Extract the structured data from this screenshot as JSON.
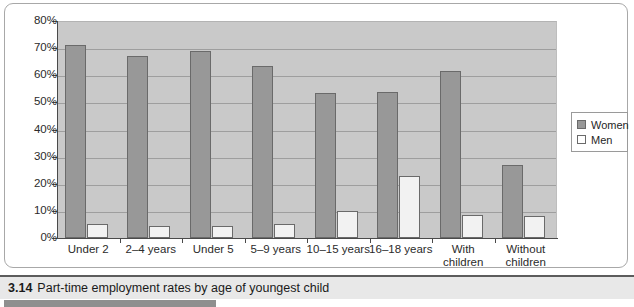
{
  "caption": {
    "number": "3.14",
    "text": "Part-time employment rates by age of youngest child"
  },
  "legend": {
    "position": "right",
    "items": [
      {
        "label": "Women",
        "color": "#989898",
        "swatch": "filled-gray-swatch"
      },
      {
        "label": "Men",
        "color": "#ffffff",
        "swatch": "empty-white-swatch"
      }
    ]
  },
  "axis": {
    "y_ticks": [
      "80%",
      "70%",
      "60%",
      "50%",
      "40%",
      "30%",
      "20%",
      "10%",
      "0%"
    ]
  },
  "chart_data": {
    "type": "bar",
    "title": "Part-time employment rates by age of youngest child",
    "xlabel": "",
    "ylabel": "",
    "ylim": [
      0,
      80
    ],
    "ytick_step": 10,
    "ytick_format": "percent",
    "grid": true,
    "legend_position": "right",
    "categories": [
      "Under 2",
      "2–4 years",
      "Under 5",
      "5–9 years",
      "10–15 years",
      "16–18 years",
      "With children",
      "Without children"
    ],
    "category_lines": [
      [
        "Under 2"
      ],
      [
        "2–4 years"
      ],
      [
        "Under 5"
      ],
      [
        "5–9 years"
      ],
      [
        "10–15 years"
      ],
      [
        "16–18 years"
      ],
      [
        "With",
        "children"
      ],
      [
        "Without",
        "children"
      ]
    ],
    "series": [
      {
        "name": "Women",
        "color": "#989898",
        "values": [
          71,
          67,
          69,
          63.5,
          53.5,
          54,
          61.5,
          27
        ]
      },
      {
        "name": "Men",
        "color": "#f2f2f2",
        "values": [
          5,
          4.5,
          4.5,
          5,
          10,
          23,
          8.5,
          8
        ]
      }
    ]
  }
}
